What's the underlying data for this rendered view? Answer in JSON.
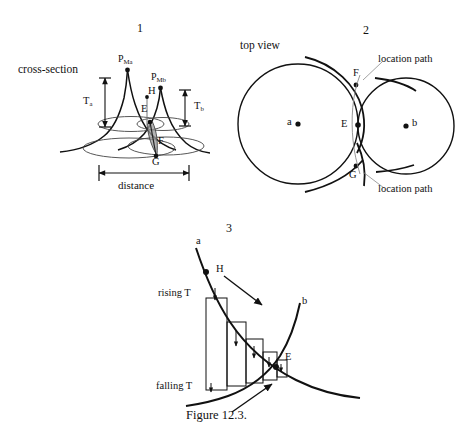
{
  "figure": {
    "caption": "Figure 12.3.",
    "panels": [
      {
        "number": "1",
        "view_label": "cross-section",
        "peak_a_label": "P",
        "peak_a_sub": "Ma",
        "peak_b_label": "P",
        "peak_b_sub": "Mb",
        "thickness_a_label": "T",
        "thickness_a_sub": "a",
        "thickness_b_label": "T",
        "thickness_b_sub": "b",
        "point_h": "H",
        "point_e": "E",
        "point_f": "F",
        "point_g": "G",
        "distance_label": "distance"
      },
      {
        "number": "2",
        "view_label": "top view",
        "circle_a_label": "a",
        "circle_b_label": "b",
        "point_e": "E",
        "point_f": "F",
        "point_g": "G",
        "location_path_top": "location path",
        "location_path_bottom": "location path"
      },
      {
        "number": "3",
        "curve_a_label": "a",
        "curve_b_label": "b",
        "point_h": "H",
        "point_e": "E",
        "rising_label": "rising T",
        "falling_label": "falling T"
      }
    ]
  },
  "colors": {
    "ink": "#111111",
    "thin_ink": "#555555",
    "shade": "#8a8a8a"
  }
}
